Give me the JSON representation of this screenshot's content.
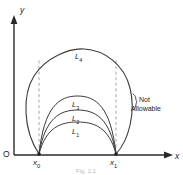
{
  "figure": {
    "caption": "Fig. 2.1",
    "axes": {
      "y_label": "y",
      "x_label": "x",
      "origin_label": "O"
    },
    "points": [
      {
        "name": "x0",
        "label_base": "x",
        "label_sub": "0"
      },
      {
        "name": "x1",
        "label_base": "x",
        "label_sub": "1"
      }
    ],
    "curves": [
      {
        "label_base": "L",
        "label_sub": "1"
      },
      {
        "label_base": "L",
        "label_sub": "2"
      },
      {
        "label_base": "L",
        "label_sub": "3"
      },
      {
        "label_base": "L",
        "label_sub": "4"
      }
    ],
    "annotation": {
      "line1": "Not",
      "line2": "Allowable"
    },
    "colors": {
      "ink": "#2a2a2a",
      "curve": "#3a3a3a",
      "dashed": "#9a9a9a",
      "background": "#ffffff"
    }
  }
}
